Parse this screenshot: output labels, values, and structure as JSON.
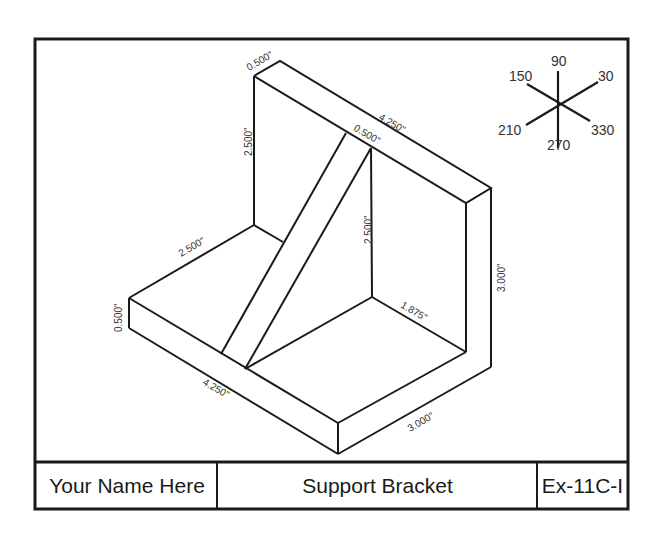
{
  "title_block": {
    "name": "Your Name Here",
    "part_title": "Support Bracket",
    "exercise_id": "Ex-11C-I"
  },
  "axis_legend": {
    "labels": {
      "a90": "90",
      "a30": "30",
      "a150": "150",
      "a210": "210",
      "a270": "270",
      "a330": "330"
    }
  },
  "dimensions": {
    "back_top_thickness": "0.500\"",
    "back_top_length": "4.250\"",
    "back_height": "2.500\"",
    "rib_thickness": "0.500\"",
    "rib_height": "2.500\"",
    "base_depth": "2.500\"",
    "base_thickness": "0.500\"",
    "base_front_length": "4.250\"",
    "inner_base_depth": "1.875\"",
    "overall_height": "3.000\"",
    "overall_depth": "3.000\""
  },
  "colors": {
    "line": "#1a1a1a",
    "text": "#333333",
    "background": "#ffffff"
  }
}
